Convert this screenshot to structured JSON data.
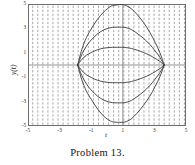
{
  "figure": {
    "caption": "Problem 13.",
    "xaxis_label": "t",
    "yaxis_label": "y(t)"
  },
  "chart_data": {
    "type": "line",
    "title": "",
    "subtitle": "",
    "xlabel": "t",
    "ylabel": "y(t)",
    "xlim": [
      -5,
      5
    ],
    "ylim": [
      -5,
      5
    ],
    "xticks": [
      -5,
      -3,
      -1,
      1,
      3,
      5
    ],
    "xtick_labels": [
      "-5",
      "-3",
      "-1",
      "1",
      "3",
      "5"
    ],
    "yticks": [
      5,
      3,
      1,
      -1,
      -3,
      -5
    ],
    "ytick_labels": [
      "5",
      "3",
      "1",
      "-1",
      "-3",
      "-5"
    ],
    "grid": false,
    "legend": "none",
    "annotations": [],
    "direction_field": {
      "style": "vertical dashes",
      "color": "#8a8a8a",
      "x_start": -4.7,
      "x_step": 0.32,
      "y_start": -4.8,
      "y_step": 0.33,
      "dash_length": 0.19
    },
    "axis_lines": {
      "horizontal_y": 0,
      "vertical_x": 1,
      "color": "#7a7a7a"
    },
    "curve_color": "#3a3a3a",
    "node_left_t": -1.85,
    "node_right_t": 3.62,
    "series": [
      {
        "name": "solution-1",
        "peak_t": 1.0,
        "peak_y": 4.95,
        "x": [
          -1.85,
          -1.6,
          -1.3,
          -1.0,
          -0.6,
          -0.2,
          0.2,
          0.5,
          0.8,
          1.0,
          1.25,
          1.55,
          1.9,
          2.3,
          2.7,
          3.05,
          3.35,
          3.62
        ],
        "y": [
          0.0,
          1.25,
          2.25,
          2.95,
          3.75,
          4.35,
          4.78,
          4.9,
          4.95,
          4.95,
          4.85,
          4.6,
          4.15,
          3.5,
          2.7,
          1.85,
          1.0,
          0.0
        ]
      },
      {
        "name": "solution-2",
        "peak_t": 1.0,
        "peak_y": 3.1,
        "x": [
          -1.85,
          -1.6,
          -1.3,
          -1.0,
          -0.6,
          -0.2,
          0.2,
          0.5,
          0.8,
          1.0,
          1.25,
          1.55,
          1.9,
          2.3,
          2.7,
          3.05,
          3.35,
          3.62
        ],
        "y": [
          0.0,
          0.85,
          1.55,
          2.05,
          2.55,
          2.88,
          3.05,
          3.1,
          3.1,
          3.1,
          3.05,
          2.9,
          2.6,
          2.2,
          1.7,
          1.15,
          0.62,
          0.0
        ]
      },
      {
        "name": "solution-3",
        "peak_t": 1.0,
        "peak_y": 1.45,
        "x": [
          -1.85,
          -1.6,
          -1.3,
          -1.0,
          -0.6,
          -0.2,
          0.2,
          0.5,
          0.8,
          1.0,
          1.25,
          1.55,
          1.9,
          2.3,
          2.7,
          3.05,
          3.35,
          3.62
        ],
        "y": [
          0.0,
          0.45,
          0.8,
          1.02,
          1.25,
          1.38,
          1.44,
          1.45,
          1.45,
          1.45,
          1.42,
          1.35,
          1.22,
          1.03,
          0.8,
          0.54,
          0.29,
          0.0
        ]
      },
      {
        "name": "solution-4",
        "peak_t": 1.0,
        "peak_y": -1.45,
        "x": [
          -1.85,
          -1.6,
          -1.3,
          -1.0,
          -0.6,
          -0.2,
          0.2,
          0.5,
          0.8,
          1.0,
          1.25,
          1.55,
          1.9,
          2.3,
          2.7,
          3.05,
          3.35,
          3.62
        ],
        "y": [
          0.0,
          -0.45,
          -0.8,
          -1.02,
          -1.25,
          -1.38,
          -1.44,
          -1.45,
          -1.45,
          -1.45,
          -1.42,
          -1.35,
          -1.22,
          -1.03,
          -0.8,
          -0.54,
          -0.29,
          0.0
        ]
      },
      {
        "name": "solution-5",
        "peak_t": 1.0,
        "peak_y": -3.1,
        "x": [
          -1.85,
          -1.6,
          -1.3,
          -1.0,
          -0.6,
          -0.2,
          0.2,
          0.5,
          0.8,
          1.0,
          1.25,
          1.55,
          1.9,
          2.3,
          2.7,
          3.05,
          3.35,
          3.62
        ],
        "y": [
          0.0,
          -0.85,
          -1.55,
          -2.05,
          -2.55,
          -2.88,
          -3.05,
          -3.1,
          -3.1,
          -3.1,
          -3.05,
          -2.9,
          -2.6,
          -2.2,
          -1.7,
          -1.15,
          -0.62,
          0.0
        ]
      },
      {
        "name": "solution-6",
        "peak_t": 1.0,
        "peak_y": -4.7,
        "x": [
          -1.85,
          -1.6,
          -1.3,
          -1.0,
          -0.6,
          -0.2,
          0.2,
          0.5,
          0.8,
          1.0,
          1.25,
          1.55,
          1.9,
          2.3,
          2.7,
          3.05,
          3.35,
          3.62
        ],
        "y": [
          0.0,
          -1.2,
          -2.15,
          -2.8,
          -3.6,
          -4.2,
          -4.58,
          -4.68,
          -4.7,
          -4.7,
          -4.62,
          -4.4,
          -3.95,
          -3.32,
          -2.58,
          -1.75,
          -0.95,
          0.0
        ]
      }
    ]
  }
}
